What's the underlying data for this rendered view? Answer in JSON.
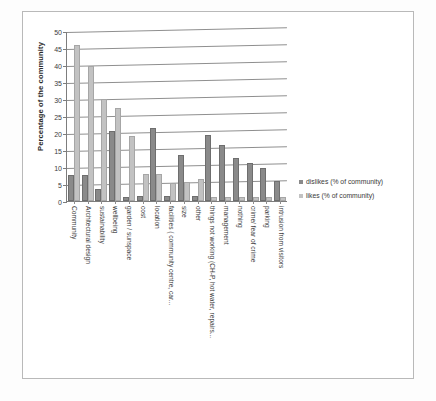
{
  "chart_data": {
    "type": "bar",
    "title": "",
    "subtitle": "",
    "xlabel": "",
    "ylabel": "Percentage of the community",
    "ylim": [
      0,
      50
    ],
    "yticks": [
      0,
      5,
      10,
      15,
      20,
      25,
      30,
      35,
      40,
      45,
      50
    ],
    "grid": true,
    "legend_position": "right",
    "orientation": "vertical",
    "categories": [
      "Community",
      "Architectural design",
      "sustainability",
      "wellbeing",
      "garden / sunspace",
      "cost",
      "location",
      "facilities ( community centre, car...",
      "size",
      "other",
      "things not working (CH-P, hot water, repairs...",
      "management",
      "nothing",
      "crime/ fear of crime",
      "parking",
      "intrusion from visitors"
    ],
    "series": [
      {
        "name": "dislikes (% of community)",
        "color": "#8a8a8a",
        "values": [
          7,
          7,
          3,
          20,
          0.5,
          1,
          21,
          1,
          13,
          1,
          19,
          16,
          12,
          10.7,
          9.3,
          5.3
        ]
      },
      {
        "name": "likes  (% of community)",
        "color": "#c2c2c2",
        "values": [
          45.5,
          39.5,
          29.5,
          27,
          18.5,
          7.5,
          7.5,
          4.7,
          5,
          6,
          0.5,
          0.5,
          0.5,
          0.5,
          0.5,
          0.5
        ]
      }
    ]
  },
  "legend": {
    "entries": [
      {
        "label": "dislikes (% of community)",
        "swatch": "dislikes"
      },
      {
        "label": "likes  (% of community)",
        "swatch": "likes"
      }
    ]
  },
  "colors": {
    "dislikes": "#8a8a8a",
    "likes": "#c2c2c2",
    "grid": "#8d8d8d",
    "axis": "#7d7d7d",
    "text": "#3a3a3a",
    "page_border": "#b9b9b9"
  }
}
